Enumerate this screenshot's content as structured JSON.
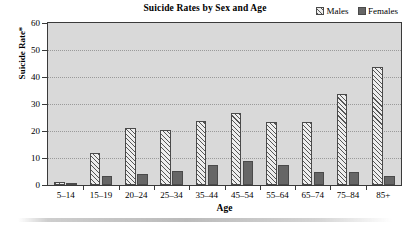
{
  "chart_data": {
    "type": "bar",
    "title": "Suicide Rates by Sex and Age",
    "xlabel": "Age",
    "ylabel": "Suicide Rate*",
    "categories": [
      "5–14",
      "15–19",
      "20–24",
      "25–34",
      "35–44",
      "45–54",
      "55–64",
      "65–74",
      "75–84",
      "85+"
    ],
    "series": [
      {
        "name": "Males",
        "values": [
          1.2,
          12.0,
          21.3,
          20.2,
          23.8,
          26.7,
          23.2,
          23.4,
          33.8,
          43.8
        ]
      },
      {
        "name": "Females",
        "values": [
          0.9,
          3.3,
          4.0,
          5.3,
          7.4,
          9.0,
          7.4,
          4.8,
          4.7,
          3.5
        ]
      }
    ],
    "ylim": [
      0,
      60
    ],
    "yticks": [
      0,
      10,
      20,
      30,
      40,
      50,
      60
    ],
    "ytick_labels": [
      "0",
      "10",
      "20",
      "30",
      "40",
      "50",
      "60"
    ],
    "grid": true,
    "legend_position": "top-right"
  },
  "legend": {
    "entries": [
      {
        "label": "Males",
        "swatch": "hatched-diagonal",
        "color": "#ededed"
      },
      {
        "label": "Females",
        "swatch": "solid",
        "color": "#666666"
      }
    ]
  },
  "colors": {
    "plot_background": "#d9d9d9",
    "axis": "#3a3a3a",
    "gridline": "#9a9a9a",
    "male_bar_fill": "#ededed",
    "male_bar_hatch": "#555555",
    "female_bar_fill": "#666666",
    "bar_border": "#4a4a4a",
    "page_background": "#ffffff"
  }
}
